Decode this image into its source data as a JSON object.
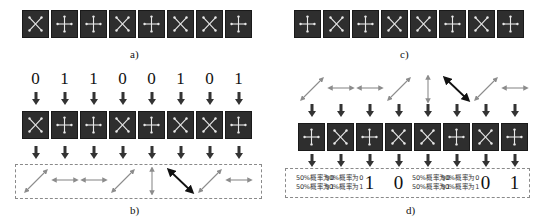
{
  "panels": {
    "a": {
      "caption": "a)",
      "bases": [
        "x",
        "plus",
        "plus",
        "x",
        "plus",
        "x",
        "x",
        "plus"
      ]
    },
    "b": {
      "caption": "b)",
      "bits": [
        "0",
        "1",
        "1",
        "0",
        "0",
        "1",
        "0",
        "1"
      ],
      "bases": [
        "x",
        "plus",
        "plus",
        "x",
        "plus",
        "x",
        "x",
        "plus"
      ],
      "polarizations": [
        "diag45",
        "horizontal",
        "horizontal",
        "diag45",
        "vertical",
        "diag135",
        "diag45",
        "horizontal"
      ]
    },
    "c": {
      "caption": "c)",
      "bases": [
        "plus",
        "x",
        "plus",
        "x",
        "x",
        "plus",
        "x",
        "plus"
      ]
    },
    "d": {
      "caption": "d)",
      "polarizations": [
        "diag45",
        "horizontal",
        "horizontal",
        "diag45",
        "vertical",
        "diag135",
        "diag45",
        "horizontal"
      ],
      "bases": [
        "plus",
        "x",
        "plus",
        "x",
        "x",
        "plus",
        "x",
        "plus"
      ],
      "results": [
        {
          "type": "random",
          "line1": "50%概率为0",
          "line2": "50%概率为1"
        },
        {
          "type": "random",
          "line1": "50%概率为0",
          "line2": "50%概率为1"
        },
        {
          "type": "bit",
          "value": "1"
        },
        {
          "type": "bit",
          "value": "0"
        },
        {
          "type": "random",
          "line1": "50%概率为0",
          "line2": "50%概率为1"
        },
        {
          "type": "random",
          "line1": "50%概率为0",
          "line2": "50%概率为1"
        },
        {
          "type": "bit",
          "value": "0"
        },
        {
          "type": "bit",
          "value": "1"
        }
      ]
    }
  },
  "colors": {
    "tile_bg": "#2e2e2e",
    "tile_glyph": "#e8e8e8",
    "arrow": "#333333",
    "pol_gray": "#8c8c8c",
    "pol_dark": "#111111",
    "dashed_border": "#8a8a8a"
  }
}
